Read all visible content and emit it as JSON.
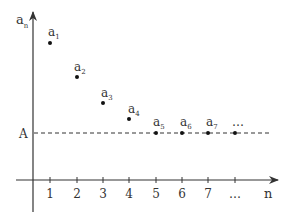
{
  "diagram": {
    "title": "",
    "y_axis_label": "a",
    "y_axis_label_sub": "n",
    "x_axis_label": "n",
    "limit_label": "A",
    "x_ticks": [
      "1",
      "2",
      "3",
      "4",
      "5",
      "6",
      "7",
      "…"
    ],
    "points": [
      {
        "label": "a",
        "sub": "1"
      },
      {
        "label": "a",
        "sub": "2"
      },
      {
        "label": "a",
        "sub": "3"
      },
      {
        "label": "a",
        "sub": "4"
      },
      {
        "label": "a",
        "sub": "5"
      },
      {
        "label": "a",
        "sub": "6"
      },
      {
        "label": "a",
        "sub": "7"
      },
      {
        "label": "…",
        "sub": ""
      }
    ],
    "colors": {
      "axis": "#333333",
      "points": "#111111",
      "dashed": "#333333"
    }
  }
}
